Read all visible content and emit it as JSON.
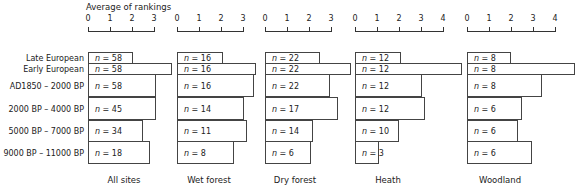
{
  "chart_data": {
    "type": "bar",
    "orientation": "horizontal",
    "title": "",
    "xlabel": "Average of rankings",
    "ylabel": "",
    "categories": [
      "Late European",
      "Early European",
      "AD1850 – 2000 BP",
      "2000 BP – 4000 BP",
      "5000 BP – 7000 BP",
      "9000 BP – 11000 BP"
    ],
    "panels": [
      {
        "name": "All sites",
        "xlim": [
          0,
          3
        ],
        "ticks": [
          "0",
          "1",
          "2",
          "3"
        ],
        "values": [
          2.05,
          3.8,
          3.1,
          3.1,
          2.5,
          2.8
        ],
        "n_labels": [
          "n = 58",
          "n = 58",
          "n = 58",
          "n = 45",
          "n = 34",
          "n = 18"
        ]
      },
      {
        "name": "Wet forest",
        "xlim": [
          0,
          3
        ],
        "ticks": [
          "0",
          "1",
          "2",
          "3"
        ],
        "values": [
          2.1,
          3.6,
          3.5,
          3.05,
          3.2,
          2.6
        ],
        "n_labels": [
          "n = 16",
          "n = 16",
          "n = 16",
          "n = 14",
          "n = 11",
          "n = 8"
        ]
      },
      {
        "name": "Dry forest",
        "xlim": [
          0,
          3
        ],
        "ticks": [
          "0",
          "1",
          "2",
          "3"
        ],
        "values": [
          2.5,
          3.9,
          2.95,
          3.3,
          2.2,
          2.1
        ],
        "n_labels": [
          "n = 22",
          "n = 22",
          "n = 22",
          "n = 17",
          "n = 14",
          "n = 6"
        ]
      },
      {
        "name": "Heath",
        "xlim": [
          0,
          4
        ],
        "ticks": [
          "0",
          "1",
          "2",
          "3",
          "4"
        ],
        "values": [
          2.1,
          4.85,
          3.05,
          3.2,
          2.0,
          1.1
        ],
        "n_labels": [
          "n = 12",
          "n = 12",
          "n = 12",
          "n = 12",
          "n = 10",
          "n = 3"
        ]
      },
      {
        "name": "Woodland",
        "xlim": [
          0,
          4
        ],
        "ticks": [
          "0",
          "1",
          "2",
          "3",
          "4"
        ],
        "values": [
          2.0,
          4.9,
          3.4,
          2.5,
          2.3,
          2.95
        ],
        "n_labels": [
          "n = 8",
          "n = 8",
          "n = 8",
          "n = 6",
          "n = 6",
          "n = 6"
        ]
      }
    ],
    "grid": false,
    "legend": "none"
  },
  "axis_title": "Average of rankings",
  "row_labels": [
    "Late European",
    "Early European",
    "AD1850 – 2000 BP",
    "2000 BP – 4000 BP",
    "5000 BP – 7000 BP",
    "9000 BP – 11000 BP"
  ],
  "panel_titles": [
    "All sites",
    "Wet forest",
    "Dry forest",
    "Heath",
    "Woodland"
  ]
}
